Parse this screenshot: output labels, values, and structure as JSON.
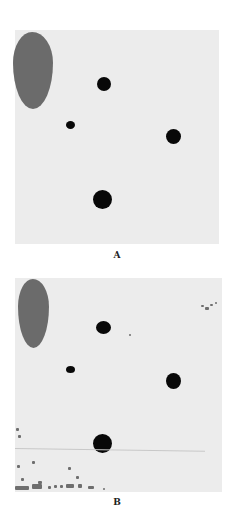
{
  "figure": {
    "panels": [
      {
        "label": "A",
        "box": {
          "x": 15,
          "y": 30,
          "w": 204,
          "h": 214
        },
        "background": "#ececec",
        "blob": {
          "x": 13,
          "y": 32,
          "w": 40,
          "h": 77,
          "color": "#6b6b6b"
        },
        "dots": [
          {
            "cx": 104,
            "cy": 84,
            "r": 7
          },
          {
            "cx": 70,
            "cy": 125,
            "r": 4
          },
          {
            "cx": 173,
            "cy": 136,
            "r": 7
          },
          {
            "cx": 102,
            "cy": 199,
            "r": 9
          }
        ],
        "label_pos": {
          "x": 107,
          "y": 250
        }
      },
      {
        "label": "B",
        "box": {
          "x": 15,
          "y": 278,
          "w": 207,
          "h": 214
        },
        "background": "#ececec",
        "blob": {
          "x": 18,
          "y": 279,
          "w": 31,
          "h": 69,
          "color": "#6b6b6b"
        },
        "dots": [
          {
            "cx": 103,
            "cy": 328,
            "r": 7
          },
          {
            "cx": 70,
            "cy": 369,
            "r": 4
          },
          {
            "cx": 173,
            "cy": 381,
            "r": 7
          },
          {
            "cx": 102,
            "cy": 443,
            "r": 9
          }
        ],
        "label_pos": {
          "x": 107,
          "y": 497
        }
      }
    ],
    "dot_color": "#080808"
  }
}
